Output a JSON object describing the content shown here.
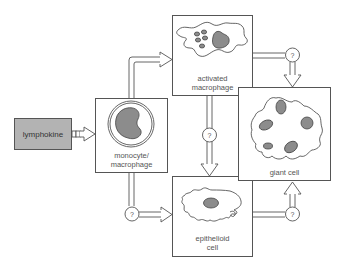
{
  "diagram": {
    "type": "flow",
    "nodes": [
      {
        "id": "lymphokine",
        "label": "lymphokine"
      },
      {
        "id": "monocyte",
        "label": "monocyte/\nmacrophage"
      },
      {
        "id": "activated",
        "label": "activated\nmacrophage"
      },
      {
        "id": "giant",
        "label": "giant cell"
      },
      {
        "id": "epithelioid",
        "label": "epithelioid\ncell"
      }
    ],
    "edges": [
      {
        "from": "lymphokine",
        "to": "monocyte",
        "marker": ""
      },
      {
        "from": "monocyte",
        "to": "activated",
        "marker": ""
      },
      {
        "from": "monocyte",
        "to": "epithelioid",
        "marker": "?"
      },
      {
        "from": "activated",
        "to": "epithelioid",
        "marker": "?"
      },
      {
        "from": "activated",
        "to": "giant",
        "marker": "?"
      },
      {
        "from": "epithelioid",
        "to": "giant",
        "marker": "?"
      }
    ],
    "unknown_marker": "?"
  },
  "colors": {
    "stroke": "#555555",
    "nucleus": "#8c8c8c",
    "lymphokine_fill": "#b3b3b3",
    "text": "#555555"
  }
}
